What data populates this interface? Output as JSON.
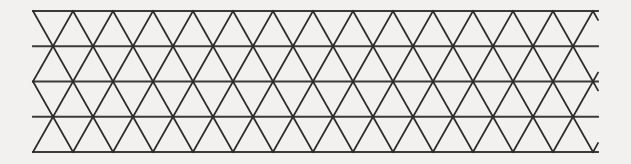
{
  "figure": {
    "type": "geometric-diagram",
    "background_color": "#f2f1ef",
    "stroke_color": "#2b2b2b",
    "horizontal_stroke_color": "#3a3a3a",
    "stroke_width": 1.7,
    "canvas": {
      "width": 631,
      "height": 164
    }
  },
  "lattice": {
    "description": "Strip of equilateral-style triangles arranged in 4 rows between 5 horizontal rails, with zigzag left and right boundaries.",
    "rows": 4,
    "rails": 5,
    "columns": 28,
    "triangle_base": 40,
    "half_base": 20,
    "row_height": 35.25,
    "origin_x": 33,
    "origin_y": 11,
    "extent_x": 598,
    "extent_y": 152,
    "rail_y_positions": [
      11,
      46.25,
      81.5,
      116.75,
      152
    ],
    "row_left_offsets": [
      0,
      20,
      0,
      20
    ],
    "row_right_offsets": [
      0,
      20,
      0,
      20
    ],
    "apex_spacing": 40,
    "notes": "Row 1 and row 3 start flush at x=33; rows 2 and 4 are shifted by a half-base so the boundary zigzags."
  },
  "chart_data": {
    "type": "diagram",
    "xlabel": "",
    "ylabel": "",
    "grid": true,
    "legend": "none",
    "rails": [
      11,
      46.25,
      81.5,
      116.75,
      152
    ],
    "x_range": [
      33,
      598
    ],
    "y_range": [
      11,
      152
    ]
  }
}
